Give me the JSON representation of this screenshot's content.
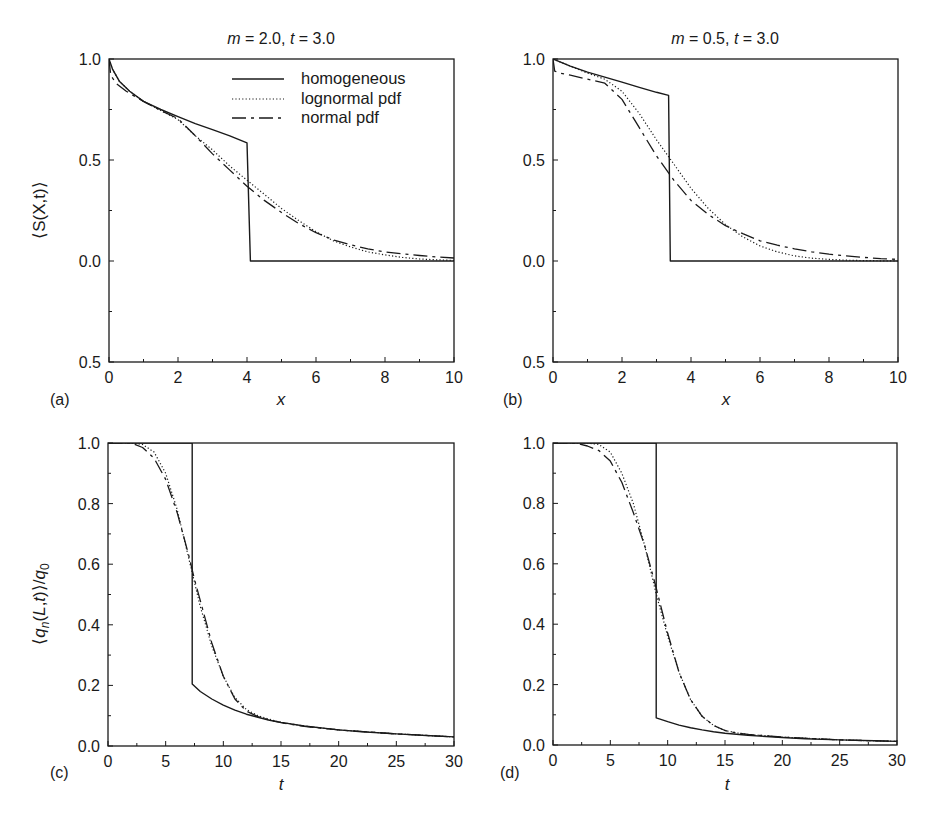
{
  "figure": {
    "panels": [
      {
        "id": "a",
        "label": "(a)",
        "title": "m = 2.0, t = 3.0",
        "title_parts": {
          "m": "m",
          "m_val": " = 2.0, ",
          "t": "t",
          "t_val": " = 3.0"
        },
        "xlabel": "x",
        "ylabel": "⟨S(X,t)⟩",
        "legend": true
      },
      {
        "id": "b",
        "label": "(b)",
        "title": "m = 0.5, t = 3.0",
        "title_parts": {
          "m": "m",
          "m_val": " = 0.5, ",
          "t": "t",
          "t_val": " = 3.0"
        },
        "xlabel": "x",
        "ylabel": "",
        "legend": false
      },
      {
        "id": "c",
        "label": "(c)",
        "title": "",
        "xlabel": "t",
        "ylabel": "⟨q_n(L,t)⟩/q_0",
        "legend": false
      },
      {
        "id": "d",
        "label": "(d)",
        "title": "",
        "xlabel": "t",
        "ylabel": "",
        "legend": false
      }
    ],
    "legend": {
      "entries": [
        {
          "label": "homogeneous",
          "style": "solid"
        },
        {
          "label": "lognormal pdf",
          "style": "dotted"
        },
        {
          "label": "normal pdf",
          "style": "dash-dot"
        }
      ]
    },
    "colors": {
      "line": "#1a1a1a",
      "background": "#ffffff"
    }
  },
  "chart_data": [
    {
      "panel": "a",
      "type": "line",
      "title": "m=2.0, t=3.0",
      "xlabel": "x",
      "ylabel": "⟨S(X,t)⟩",
      "xlim": [
        0,
        10
      ],
      "ylim": [
        -0.5,
        1.0
      ],
      "xticks": [
        0,
        2,
        4,
        6,
        8,
        10
      ],
      "yticks": [
        1.0,
        0.5,
        0.0,
        -0.5
      ],
      "ytick_labels": [
        "1.0",
        "0.5",
        "0.0",
        "0.5"
      ],
      "grid": false,
      "legend_position": "upper right",
      "series": [
        {
          "name": "homogeneous",
          "style": "solid",
          "x": [
            0,
            0.1,
            0.3,
            0.6,
            1.0,
            1.5,
            2.0,
            2.5,
            3.0,
            3.5,
            4.0,
            4.1,
            5,
            6,
            7,
            8,
            9,
            10
          ],
          "y": [
            1.0,
            0.95,
            0.89,
            0.84,
            0.79,
            0.75,
            0.715,
            0.68,
            0.65,
            0.62,
            0.585,
            0.0,
            0,
            0,
            0,
            0,
            0,
            0
          ]
        },
        {
          "name": "lognormal pdf",
          "style": "dotted",
          "x": [
            0,
            0.1,
            0.3,
            0.6,
            1.0,
            1.5,
            2.0,
            2.5,
            3.0,
            3.5,
            4.0,
            4.5,
            5.0,
            5.5,
            6.0,
            6.5,
            7.0,
            7.5,
            8.0,
            8.5,
            9.0,
            9.5,
            10
          ],
          "y": [
            1.0,
            0.95,
            0.89,
            0.84,
            0.79,
            0.745,
            0.7,
            0.62,
            0.55,
            0.47,
            0.4,
            0.33,
            0.26,
            0.2,
            0.145,
            0.1,
            0.07,
            0.045,
            0.03,
            0.018,
            0.01,
            0.006,
            0.003
          ]
        },
        {
          "name": "normal pdf",
          "style": "dash-dot",
          "x": [
            0,
            0.05,
            0.2,
            0.5,
            1.0,
            1.5,
            2.0,
            2.5,
            3.0,
            3.5,
            4.0,
            4.5,
            5.0,
            5.5,
            6.0,
            6.5,
            7.0,
            7.5,
            8.0,
            8.5,
            9.0,
            9.5,
            10
          ],
          "y": [
            1.0,
            0.92,
            0.88,
            0.84,
            0.79,
            0.745,
            0.705,
            0.62,
            0.53,
            0.45,
            0.37,
            0.3,
            0.24,
            0.185,
            0.14,
            0.105,
            0.08,
            0.06,
            0.045,
            0.035,
            0.027,
            0.02,
            0.015
          ]
        }
      ]
    },
    {
      "panel": "b",
      "type": "line",
      "title": "m=0.5, t=3.0",
      "xlabel": "x",
      "ylabel": "",
      "xlim": [
        0,
        10
      ],
      "ylim": [
        -0.5,
        1.0
      ],
      "xticks": [
        0,
        2,
        4,
        6,
        8,
        10
      ],
      "yticks": [
        1.0,
        0.5,
        0.0,
        -0.5
      ],
      "ytick_labels": [
        "1.0",
        "0.5",
        "0.0",
        "0.5"
      ],
      "grid": false,
      "series": [
        {
          "name": "homogeneous",
          "style": "solid",
          "x": [
            0,
            0.5,
            1.0,
            1.5,
            2.0,
            2.5,
            3.0,
            3.35,
            3.4,
            5,
            6,
            7,
            8,
            9,
            10
          ],
          "y": [
            1.0,
            0.965,
            0.935,
            0.91,
            0.885,
            0.86,
            0.835,
            0.82,
            0.0,
            0,
            0,
            0,
            0,
            0,
            0
          ]
        },
        {
          "name": "lognormal pdf",
          "style": "dotted",
          "x": [
            0,
            0.5,
            1.0,
            1.5,
            2.0,
            2.5,
            3.0,
            3.5,
            4.0,
            4.5,
            5.0,
            5.5,
            6.0,
            6.5,
            7.0,
            7.5,
            8.0,
            8.5,
            9.0,
            9.5,
            10
          ],
          "y": [
            1.0,
            0.965,
            0.93,
            0.9,
            0.84,
            0.73,
            0.6,
            0.48,
            0.36,
            0.26,
            0.18,
            0.12,
            0.075,
            0.045,
            0.025,
            0.014,
            0.008,
            0.004,
            0.002,
            0.001,
            0.0
          ]
        },
        {
          "name": "normal pdf",
          "style": "dash-dot",
          "x": [
            0,
            0.05,
            0.2,
            0.5,
            1.0,
            1.5,
            2.0,
            2.5,
            3.0,
            3.5,
            4.0,
            4.5,
            5.0,
            5.5,
            6.0,
            6.5,
            7.0,
            7.5,
            8.0,
            8.5,
            9.0,
            9.5,
            10
          ],
          "y": [
            1.0,
            0.94,
            0.93,
            0.92,
            0.9,
            0.88,
            0.8,
            0.66,
            0.52,
            0.4,
            0.3,
            0.23,
            0.175,
            0.135,
            0.1,
            0.078,
            0.06,
            0.045,
            0.034,
            0.025,
            0.018,
            0.012,
            0.008
          ]
        }
      ]
    },
    {
      "panel": "c",
      "type": "line",
      "title": "",
      "xlabel": "t",
      "ylabel": "⟨q_n(L,t)⟩/q_0",
      "xlim": [
        0,
        30
      ],
      "ylim": [
        0.0,
        1.0
      ],
      "xticks": [
        0,
        5,
        10,
        15,
        20,
        25,
        30
      ],
      "yticks": [
        0.0,
        0.2,
        0.4,
        0.6,
        0.8,
        1.0
      ],
      "grid": false,
      "series": [
        {
          "name": "homogeneous",
          "style": "solid",
          "x": [
            0,
            7.3,
            7.3,
            8,
            9,
            10,
            11,
            12,
            13,
            14,
            15,
            17,
            20,
            22,
            25,
            28,
            30
          ],
          "y": [
            1.0,
            1.0,
            0.205,
            0.18,
            0.155,
            0.135,
            0.118,
            0.105,
            0.095,
            0.085,
            0.078,
            0.066,
            0.053,
            0.047,
            0.04,
            0.034,
            0.03
          ]
        },
        {
          "name": "lognormal pdf",
          "style": "dotted",
          "x": [
            0,
            2,
            3,
            4,
            5,
            6,
            7,
            7.5,
            8,
            9,
            10,
            11,
            12,
            13,
            14,
            15,
            17,
            20,
            25,
            30
          ],
          "y": [
            1.0,
            1.0,
            0.995,
            0.97,
            0.9,
            0.78,
            0.62,
            0.54,
            0.46,
            0.33,
            0.23,
            0.16,
            0.12,
            0.1,
            0.088,
            0.078,
            0.066,
            0.053,
            0.04,
            0.03
          ]
        },
        {
          "name": "normal pdf",
          "style": "dash-dot",
          "x": [
            0,
            2,
            3,
            4,
            5,
            6,
            7,
            7.5,
            8,
            9,
            10,
            11,
            12,
            13,
            14,
            15,
            17,
            20,
            25,
            30
          ],
          "y": [
            1.0,
            1.0,
            0.985,
            0.95,
            0.88,
            0.77,
            0.63,
            0.55,
            0.48,
            0.34,
            0.23,
            0.155,
            0.115,
            0.097,
            0.085,
            0.077,
            0.065,
            0.053,
            0.04,
            0.03
          ]
        }
      ]
    },
    {
      "panel": "d",
      "type": "line",
      "title": "",
      "xlabel": "t",
      "ylabel": "",
      "xlim": [
        0,
        30
      ],
      "ylim": [
        0.0,
        1.0
      ],
      "xticks": [
        0,
        5,
        10,
        15,
        20,
        25,
        30
      ],
      "yticks": [
        0.0,
        0.2,
        0.4,
        0.6,
        0.8,
        1.0
      ],
      "grid": false,
      "series": [
        {
          "name": "homogeneous",
          "style": "solid",
          "x": [
            0,
            9.0,
            9.0,
            10,
            11,
            12,
            13,
            14,
            15,
            17,
            20,
            22,
            25,
            28,
            30
          ],
          "y": [
            1.0,
            1.0,
            0.09,
            0.077,
            0.066,
            0.057,
            0.05,
            0.044,
            0.039,
            0.032,
            0.025,
            0.021,
            0.017,
            0.014,
            0.012
          ]
        },
        {
          "name": "lognormal pdf",
          "style": "dotted",
          "x": [
            0,
            3,
            4,
            5,
            6,
            7,
            8,
            8.5,
            9,
            10,
            11,
            12,
            13,
            14,
            15,
            16,
            17,
            20,
            25,
            30
          ],
          "y": [
            1.0,
            1.0,
            0.995,
            0.97,
            0.9,
            0.8,
            0.66,
            0.58,
            0.5,
            0.36,
            0.24,
            0.15,
            0.095,
            0.065,
            0.048,
            0.04,
            0.035,
            0.026,
            0.017,
            0.012
          ]
        },
        {
          "name": "normal pdf",
          "style": "dash-dot",
          "x": [
            0,
            2,
            3,
            4,
            5,
            6,
            7,
            8,
            8.5,
            9,
            10,
            11,
            12,
            13,
            14,
            15,
            16,
            17,
            20,
            25,
            30
          ],
          "y": [
            1.0,
            1.0,
            0.99,
            0.975,
            0.94,
            0.87,
            0.77,
            0.66,
            0.59,
            0.52,
            0.37,
            0.24,
            0.15,
            0.095,
            0.065,
            0.048,
            0.04,
            0.035,
            0.026,
            0.017,
            0.012
          ]
        }
      ]
    }
  ]
}
